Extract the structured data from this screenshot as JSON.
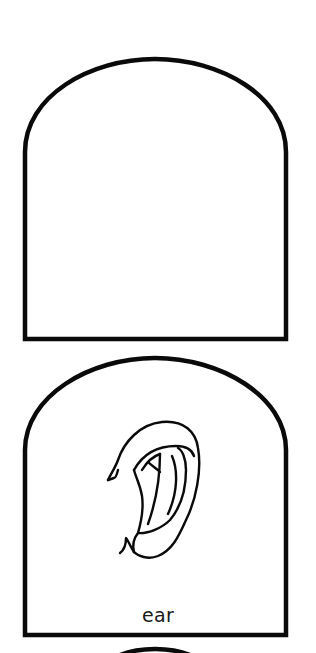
{
  "page": {
    "background": "#ffffff",
    "stroke_color": "#0a0a0a"
  },
  "cards": [
    {
      "label": "",
      "image": "blank"
    },
    {
      "label": "ear",
      "image": "ear-drawing"
    },
    {
      "label": "",
      "image": "partial-card-top"
    }
  ]
}
